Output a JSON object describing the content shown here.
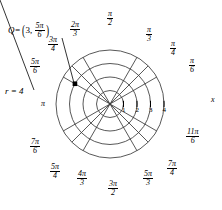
{
  "figure": {
    "type": "polar-grid-diagram",
    "center": {
      "x": 110,
      "y": 104
    },
    "unit_px": 13.5,
    "max_radius_units": 4,
    "background": "#ffffff",
    "grid_color": "#3a3a3a",
    "axis_color": "#000000",
    "point_color": "#000000"
  },
  "chart_data": {
    "type": "scatter",
    "title": "",
    "coordinate_system": "polar",
    "radial_gridlines": [
      1,
      2,
      3,
      4
    ],
    "angular_gridlines_deg": [
      0,
      30,
      45,
      60,
      90,
      120,
      135,
      150,
      180,
      210,
      225,
      240,
      270,
      300,
      315,
      330
    ],
    "points": [
      {
        "name": "Q",
        "r": 3,
        "theta": "5pi/6",
        "theta_deg": 150
      }
    ],
    "xlabel": "x",
    "ylabel": "",
    "xlim": [
      -4,
      4
    ],
    "ylim": [
      -4,
      4
    ],
    "grid": true,
    "legend": "none"
  },
  "annotations": {
    "point_label": {
      "name": "Q",
      "equals": "=",
      "open_paren": "(",
      "close_paren": ")",
      "r_value": "3",
      "comma": ",",
      "theta_num": "5π",
      "theta_den": "6"
    },
    "radius_callout": {
      "text": "r = 4",
      "r_symbol": "r",
      "equals": "=",
      "value": "4"
    }
  },
  "axes": {
    "x_axis_label": "x",
    "tick_labels": [
      "1",
      "2",
      "3",
      "4"
    ]
  },
  "angle_labels": [
    {
      "id": "pi-over-6",
      "deg": 30,
      "num": "π",
      "den": "6",
      "x": 189,
      "y": 57
    },
    {
      "id": "pi-over-4",
      "deg": 45,
      "num": "π",
      "den": "4",
      "x": 170,
      "y": 40
    },
    {
      "id": "pi-over-3",
      "deg": 60,
      "num": "π",
      "den": "3",
      "x": 146,
      "y": 26
    },
    {
      "id": "pi-over-2",
      "deg": 90,
      "num": "π",
      "den": "2",
      "x": 107,
      "y": 10
    },
    {
      "id": "two-pi-over-3",
      "deg": 120,
      "num": "2π",
      "den": "3",
      "x": 70,
      "y": 21
    },
    {
      "id": "three-pi-over-4",
      "deg": 135,
      "num": "3π",
      "den": "4",
      "x": 48,
      "y": 36
    },
    {
      "id": "five-pi-over-6",
      "deg": 150,
      "num": "5π",
      "den": "6",
      "x": 30,
      "y": 58
    },
    {
      "id": "pi",
      "deg": 180,
      "num": "π",
      "den": "",
      "x": 41,
      "y": 100
    },
    {
      "id": "seven-pi-over-6",
      "deg": 210,
      "num": "7π",
      "den": "6",
      "x": 30,
      "y": 138
    },
    {
      "id": "five-pi-over-4",
      "deg": 225,
      "num": "5π",
      "den": "4",
      "x": 50,
      "y": 163
    },
    {
      "id": "four-pi-over-3",
      "deg": 240,
      "num": "4π",
      "den": "3",
      "x": 77,
      "y": 170
    },
    {
      "id": "three-pi-over-2",
      "deg": 270,
      "num": "3π",
      "den": "2",
      "x": 108,
      "y": 180
    },
    {
      "id": "five-pi-over-3",
      "deg": 300,
      "num": "5π",
      "den": "3",
      "x": 143,
      "y": 170
    },
    {
      "id": "seven-pi-over-4",
      "deg": 315,
      "num": "7π",
      "den": "4",
      "x": 167,
      "y": 160
    },
    {
      "id": "eleven-pi-over-6",
      "deg": 330,
      "num": "11π",
      "den": "6",
      "x": 186,
      "y": 128
    }
  ]
}
